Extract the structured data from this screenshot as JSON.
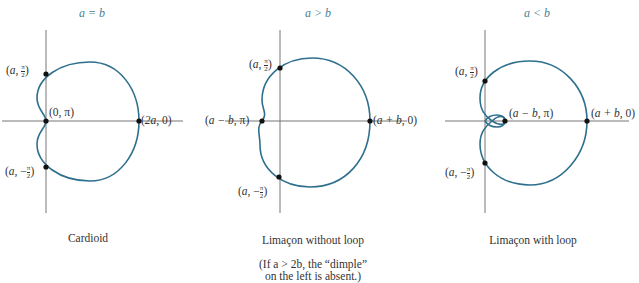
{
  "colors": {
    "curve": "#2e6f8e",
    "axis": "#777777",
    "title": "#4a7f95",
    "point": "#111111"
  },
  "panels": [
    {
      "title": "a = b",
      "caption": "Cardioid",
      "note": "",
      "labels": {
        "top": "(a, π/2)",
        "origin": "(0, π)",
        "right": "(2a, 0)",
        "bottom": "(a, −π/2)"
      },
      "points": [
        {
          "label": "(a, π/2)",
          "x": 46,
          "y": 74
        },
        {
          "label": "(0, π)",
          "x": 46,
          "y": 121
        },
        {
          "label": "(2a, 0)",
          "x": 139,
          "y": 121
        },
        {
          "label": "(a, −π/2)",
          "x": 46,
          "y": 167
        }
      ]
    },
    {
      "title": "a > b",
      "caption": "Limaçon without loop",
      "note_line1": "(If a > 2b, the “dimple”",
      "note_line2": "on the left is absent.)",
      "labels": {
        "top": "(a, π/2)",
        "left": "(a − b, π)",
        "right": "(a + b, 0)",
        "bottom": "(a, −π/2)"
      },
      "points": [
        {
          "label": "(a, π/2)",
          "x": 280,
          "y": 68
        },
        {
          "label": "(a − b, π)",
          "x": 262,
          "y": 121
        },
        {
          "label": "(a + b, 0)",
          "x": 370,
          "y": 121
        },
        {
          "label": "(a, −π/2)",
          "x": 279,
          "y": 177
        }
      ]
    },
    {
      "title": "a < b",
      "caption": "Limaçon with loop",
      "note": "",
      "labels": {
        "top": "(a, π/2)",
        "inner": "(a − b, π)",
        "right": "(a + b, 0)",
        "bottom": "(a, −π/2)"
      },
      "points": [
        {
          "label": "(a, π/2)",
          "x": 485,
          "y": 81
        },
        {
          "label": "(a − b, π)",
          "x": 505,
          "y": 121
        },
        {
          "label": "(a + b, 0)",
          "x": 587,
          "y": 121
        },
        {
          "label": "(a, −π/2)",
          "x": 485,
          "y": 163
        }
      ]
    }
  ],
  "text": {
    "p1_top_a": "a",
    "p1_origin": "(0, π)",
    "p1_right_a": "2a",
    "p1_bot_a": "a",
    "p2_top_a": "a",
    "p2_left": "a − b",
    "p2_right": "a + b",
    "p2_bot_a": "a",
    "p3_top_a": "a",
    "p3_inner": "a − b",
    "p3_right": "a + b",
    "p3_bot_a": "a",
    "pi": "π",
    "two": "2",
    "minus": "−"
  }
}
